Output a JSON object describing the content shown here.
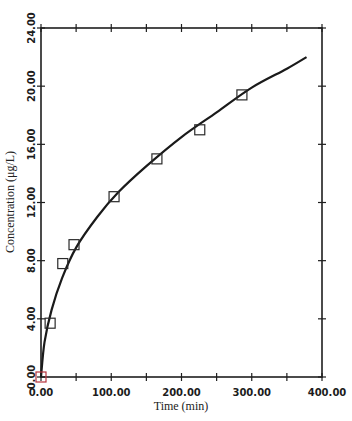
{
  "chart_data": {
    "type": "scatter",
    "title": "",
    "xlabel": "Time (min)",
    "ylabel": "Concentration (μg/L)",
    "xlim": [
      0,
      400
    ],
    "ylim": [
      0,
      24
    ],
    "x_ticks": [
      "0.00",
      "100.00",
      "200.00",
      "300.00",
      "400.00"
    ],
    "y_ticks": [
      "0.00",
      "4.00",
      "8.00",
      "12.00",
      "16.00",
      "20.00",
      "24.00"
    ],
    "grid": false,
    "legend": null,
    "series": [
      {
        "name": "Measured",
        "marker": "open-square",
        "x": [
          0,
          13,
          31,
          47,
          104,
          165,
          226,
          286
        ],
        "y": [
          0.0,
          3.7,
          7.8,
          9.1,
          12.4,
          15.0,
          17.0,
          19.4
        ]
      },
      {
        "name": "Fitted curve",
        "marker": "line",
        "x": [
          0,
          5,
          15,
          30,
          50,
          80,
          110,
          150,
          200,
          250,
          300,
          350,
          378
        ],
        "y": [
          0,
          2.4,
          4.6,
          6.8,
          8.9,
          11.0,
          12.7,
          14.5,
          16.5,
          18.2,
          19.9,
          21.2,
          22.0
        ]
      }
    ]
  }
}
